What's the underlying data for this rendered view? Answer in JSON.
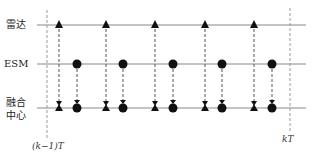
{
  "rows": [
    {
      "label": "雷达",
      "y": 25
    },
    {
      "label": "ESM",
      "y": 64
    },
    {
      "label_line1": "融合",
      "label_line2": "中心",
      "y": 108
    }
  ],
  "time_marks": {
    "start": "(k−1)T",
    "end": "kT"
  },
  "radar_x": [
    59,
    106,
    155,
    205,
    254
  ],
  "esm_x": [
    77,
    123,
    173,
    222,
    272
  ],
  "line_color": "#888888",
  "marker_color": "#111111"
}
